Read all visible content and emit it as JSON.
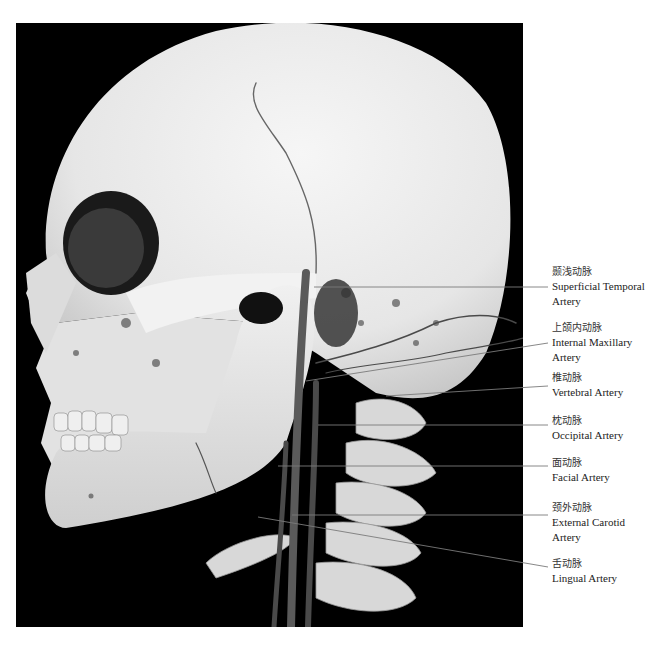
{
  "figure": {
    "labels": [
      {
        "id": "superficial-temporal",
        "zh": "颞浅动脉",
        "en": [
          "Superficial Temporal",
          "Artery"
        ]
      },
      {
        "id": "internal-maxillary",
        "zh": "上颌内动脉",
        "en": [
          "Internal Maxillary",
          "Artery"
        ]
      },
      {
        "id": "vertebral",
        "zh": "椎动脉",
        "en": [
          "Vertebral Artery"
        ]
      },
      {
        "id": "occipital",
        "zh": "枕动脉",
        "en": [
          "Occipital Artery"
        ]
      },
      {
        "id": "facial",
        "zh": "面动脉",
        "en": [
          "Facial Artery"
        ]
      },
      {
        "id": "external-carotid",
        "zh": "颈外动脉",
        "en": [
          "External Carotid",
          "Artery"
        ]
      },
      {
        "id": "lingual",
        "zh": "舌动脉",
        "en": [
          "Lingual Artery"
        ]
      }
    ]
  },
  "caption": {
    "text": ""
  },
  "colors": {
    "background": "#000000",
    "bone": "#eeeeee",
    "vessel": "#3a3a3a",
    "leader": "#666666"
  }
}
